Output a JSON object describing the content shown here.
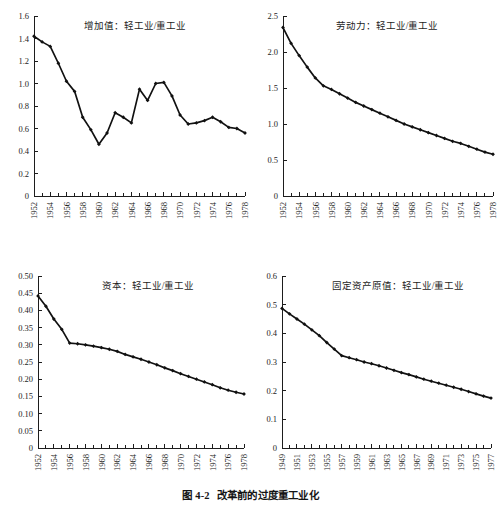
{
  "figure": {
    "caption_number": "图 4-2",
    "caption_text": "改革前的过度重工业化",
    "background": "#ffffff",
    "ink": "#111111"
  },
  "chart_data": [
    {
      "id": "value-added",
      "type": "line",
      "title": "增加值：轻工业/重工业",
      "xlabel": "",
      "ylabel": "",
      "xlim": [
        1952,
        1978
      ],
      "ylim": [
        0,
        1.6
      ],
      "yticks": [
        "0",
        "0.2",
        "0.4",
        "0.6",
        "0.8",
        "1.0",
        "1.2",
        "1.4",
        "1.6"
      ],
      "ytick_values": [
        0,
        0.2,
        0.4,
        0.6,
        0.8,
        1.0,
        1.2,
        1.4,
        1.6
      ],
      "xticks": [
        "1952",
        "1954",
        "1956",
        "1958",
        "1960",
        "1962",
        "1964",
        "1966",
        "1968",
        "1970",
        "1972",
        "1974",
        "1976",
        "1978"
      ],
      "xtick_values": [
        1952,
        1954,
        1956,
        1958,
        1960,
        1962,
        1964,
        1966,
        1968,
        1970,
        1972,
        1974,
        1976,
        1978
      ],
      "grid": false,
      "legend": "none",
      "x": [
        1952,
        1953,
        1954,
        1955,
        1956,
        1957,
        1958,
        1959,
        1960,
        1961,
        1962,
        1963,
        1964,
        1965,
        1966,
        1967,
        1968,
        1969,
        1970,
        1971,
        1972,
        1973,
        1974,
        1975,
        1976,
        1977,
        1978
      ],
      "values": [
        1.42,
        1.37,
        1.33,
        1.18,
        1.02,
        0.93,
        0.7,
        0.59,
        0.46,
        0.56,
        0.74,
        0.7,
        0.65,
        0.95,
        0.85,
        1.0,
        1.01,
        0.89,
        0.72,
        0.64,
        0.65,
        0.67,
        0.7,
        0.66,
        0.61,
        0.6,
        0.56
      ]
    },
    {
      "id": "labor",
      "type": "line",
      "title": "劳动力：轻工业/重工业",
      "xlabel": "",
      "ylabel": "",
      "xlim": [
        1952,
        1978
      ],
      "ylim": [
        0,
        2.5
      ],
      "yticks": [
        "0",
        "0.5",
        "1.0",
        "1.5",
        "2.0",
        "2.5"
      ],
      "ytick_values": [
        0,
        0.5,
        1.0,
        1.5,
        2.0,
        2.5
      ],
      "xticks": [
        "1952",
        "1954",
        "1956",
        "1958",
        "1960",
        "1962",
        "1964",
        "1966",
        "1968",
        "1970",
        "1972",
        "1974",
        "1976",
        "1978"
      ],
      "xtick_values": [
        1952,
        1954,
        1956,
        1958,
        1960,
        1962,
        1964,
        1966,
        1968,
        1970,
        1972,
        1974,
        1976,
        1978
      ],
      "grid": false,
      "legend": "none",
      "x": [
        1952,
        1953,
        1954,
        1955,
        1956,
        1957,
        1958,
        1959,
        1960,
        1961,
        1962,
        1963,
        1964,
        1965,
        1966,
        1967,
        1968,
        1969,
        1970,
        1971,
        1972,
        1973,
        1974,
        1975,
        1976,
        1977,
        1978
      ],
      "values": [
        2.34,
        2.12,
        1.95,
        1.79,
        1.64,
        1.53,
        1.48,
        1.42,
        1.36,
        1.3,
        1.25,
        1.2,
        1.15,
        1.1,
        1.05,
        1.0,
        0.96,
        0.92,
        0.88,
        0.84,
        0.8,
        0.76,
        0.73,
        0.69,
        0.65,
        0.61,
        0.58
      ]
    },
    {
      "id": "capital",
      "type": "line",
      "title": "资本：轻工业/重工业",
      "xlabel": "",
      "ylabel": "",
      "xlim": [
        1952,
        1978
      ],
      "ylim": [
        0,
        0.5
      ],
      "yticks": [
        "0",
        "0.05",
        "0.10",
        "0.15",
        "0.20",
        "0.25",
        "0.30",
        "0.35",
        "0.40",
        "0.45",
        "0.50"
      ],
      "ytick_values": [
        0,
        0.05,
        0.1,
        0.15,
        0.2,
        0.25,
        0.3,
        0.35,
        0.4,
        0.45,
        0.5
      ],
      "xticks": [
        "1952",
        "1954",
        "1956",
        "1958",
        "1960",
        "1962",
        "1964",
        "1966",
        "1968",
        "1970",
        "1972",
        "1974",
        "1976",
        "1978"
      ],
      "xtick_values": [
        1952,
        1954,
        1956,
        1958,
        1960,
        1962,
        1964,
        1966,
        1968,
        1970,
        1972,
        1974,
        1976,
        1978
      ],
      "grid": false,
      "legend": "none",
      "x": [
        1952,
        1953,
        1954,
        1955,
        1956,
        1957,
        1958,
        1959,
        1960,
        1961,
        1962,
        1963,
        1964,
        1965,
        1966,
        1967,
        1968,
        1969,
        1970,
        1971,
        1972,
        1973,
        1974,
        1975,
        1976,
        1977,
        1978
      ],
      "values": [
        0.442,
        0.412,
        0.375,
        0.345,
        0.305,
        0.303,
        0.3,
        0.296,
        0.292,
        0.287,
        0.281,
        0.272,
        0.265,
        0.258,
        0.25,
        0.242,
        0.233,
        0.225,
        0.216,
        0.208,
        0.2,
        0.192,
        0.184,
        0.175,
        0.168,
        0.162,
        0.157
      ]
    },
    {
      "id": "fixed-assets",
      "type": "line",
      "title": "固定资产原值：轻工业/重工业",
      "xlabel": "",
      "ylabel": "",
      "xlim": [
        1949,
        1977
      ],
      "ylim": [
        0,
        0.6
      ],
      "yticks": [
        "0",
        "0.1",
        "0.2",
        "0.3",
        "0.4",
        "0.5",
        "0.6"
      ],
      "ytick_values": [
        0,
        0.1,
        0.2,
        0.3,
        0.4,
        0.5,
        0.6
      ],
      "xticks": [
        "1949",
        "1951",
        "1953",
        "1955",
        "1957",
        "1959",
        "1961",
        "1963",
        "1965",
        "1967",
        "1969",
        "1971",
        "1973",
        "1975",
        "1977"
      ],
      "xtick_values": [
        1949,
        1951,
        1953,
        1955,
        1957,
        1959,
        1961,
        1963,
        1965,
        1967,
        1969,
        1971,
        1973,
        1975,
        1977
      ],
      "grid": false,
      "legend": "none",
      "x": [
        1949,
        1950,
        1951,
        1952,
        1953,
        1954,
        1955,
        1956,
        1957,
        1958,
        1959,
        1960,
        1961,
        1962,
        1963,
        1964,
        1965,
        1966,
        1967,
        1968,
        1969,
        1970,
        1971,
        1972,
        1973,
        1974,
        1975,
        1976,
        1977
      ],
      "values": [
        0.487,
        0.468,
        0.45,
        0.432,
        0.412,
        0.392,
        0.368,
        0.345,
        0.322,
        0.315,
        0.308,
        0.3,
        0.294,
        0.287,
        0.279,
        0.271,
        0.263,
        0.256,
        0.248,
        0.24,
        0.233,
        0.226,
        0.219,
        0.212,
        0.205,
        0.197,
        0.189,
        0.181,
        0.174
      ]
    }
  ]
}
